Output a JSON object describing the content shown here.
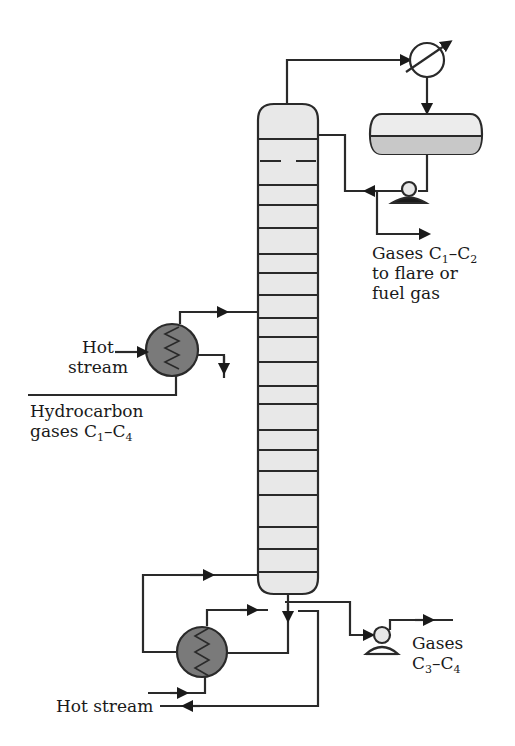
{
  "diagram": {
    "type": "process-flow",
    "title": "",
    "equipment": [
      {
        "id": "column",
        "name": "distillation-column",
        "trays": 19
      },
      {
        "id": "condenser",
        "name": "overhead-condenser"
      },
      {
        "id": "drum",
        "name": "reflux-drum"
      },
      {
        "id": "reflux-pump",
        "name": "reflux-pump"
      },
      {
        "id": "feed-heater",
        "name": "feed-preheater"
      },
      {
        "id": "reboiler",
        "name": "reboiler"
      },
      {
        "id": "bottoms-pump",
        "name": "bottoms-pump"
      }
    ],
    "labels": {
      "top_product": {
        "line1_pre": "Gases C",
        "line1_sub1": "1",
        "line1_mid": "–C",
        "line1_sub2": "2",
        "line2": "to flare or",
        "line3": "fuel gas"
      },
      "feed_hot": {
        "line1": "Hot",
        "line2": "stream"
      },
      "feed": {
        "line1": "Hydrocarbon",
        "line2_pre": "gases C",
        "line2_sub1": "1",
        "line2_mid": "–C",
        "line2_sub2": "4"
      },
      "bottom_product": {
        "line1": "Gases",
        "line2_pre": "C",
        "line2_sub1": "3",
        "line2_mid": "–C",
        "line2_sub2": "4"
      },
      "reboiler_hot": {
        "text": "Hot stream"
      }
    },
    "colors": {
      "line": "#2a2a2a",
      "vessel_fill": "#e8e8e8",
      "hx_fill": "#7a7a7a",
      "drum_liquid": "#c8c8c8"
    }
  }
}
